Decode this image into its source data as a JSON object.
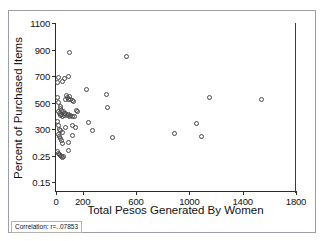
{
  "chart_data": {
    "type": "scatter",
    "title": "",
    "xlabel": "Total Pesos Generated By Women",
    "ylabel": "Percent of Purchased Items",
    "xlim": [
      0,
      1800
    ],
    "ylim_index": [
      0,
      6
    ],
    "grid": false,
    "legend": null,
    "marker": "open-circle",
    "xticks": [
      0,
      200,
      600,
      1000,
      1400,
      1800
    ],
    "xtick_labels": [
      "0",
      "200",
      "600",
      "1000",
      "1400",
      "1800"
    ],
    "ytick_labels": [
      "1100",
      "900",
      "700",
      "500",
      "300",
      "0.25",
      "0.15"
    ],
    "ytick_values": [
      1100,
      900,
      700,
      500,
      300,
      125,
      15
    ],
    "annotation": "Correlation: r=..07853",
    "points": [
      {
        "x": 10,
        "y": 650
      },
      {
        "x": 20,
        "y": 690
      },
      {
        "x": 48,
        "y": 660
      },
      {
        "x": 60,
        "y": 680
      },
      {
        "x": 95,
        "y": 695
      },
      {
        "x": 100,
        "y": 880
      },
      {
        "x": 12,
        "y": 540
      },
      {
        "x": 18,
        "y": 500
      },
      {
        "x": 30,
        "y": 470
      },
      {
        "x": 35,
        "y": 455
      },
      {
        "x": 40,
        "y": 440
      },
      {
        "x": 55,
        "y": 430
      },
      {
        "x": 62,
        "y": 420
      },
      {
        "x": 70,
        "y": 525
      },
      {
        "x": 78,
        "y": 555
      },
      {
        "x": 85,
        "y": 540
      },
      {
        "x": 92,
        "y": 520
      },
      {
        "x": 100,
        "y": 545
      },
      {
        "x": 108,
        "y": 520
      },
      {
        "x": 120,
        "y": 512
      },
      {
        "x": 128,
        "y": 505
      },
      {
        "x": 20,
        "y": 430
      },
      {
        "x": 26,
        "y": 415
      },
      {
        "x": 34,
        "y": 400
      },
      {
        "x": 44,
        "y": 412
      },
      {
        "x": 52,
        "y": 398
      },
      {
        "x": 66,
        "y": 405
      },
      {
        "x": 74,
        "y": 420
      },
      {
        "x": 88,
        "y": 400
      },
      {
        "x": 96,
        "y": 408
      },
      {
        "x": 104,
        "y": 398
      },
      {
        "x": 112,
        "y": 405
      },
      {
        "x": 126,
        "y": 395
      },
      {
        "x": 140,
        "y": 392
      },
      {
        "x": 150,
        "y": 440
      },
      {
        "x": 160,
        "y": 430
      },
      {
        "x": 14,
        "y": 355
      },
      {
        "x": 22,
        "y": 330
      },
      {
        "x": 28,
        "y": 300
      },
      {
        "x": 36,
        "y": 290
      },
      {
        "x": 46,
        "y": 280
      },
      {
        "x": 70,
        "y": 310
      },
      {
        "x": 120,
        "y": 330
      },
      {
        "x": 145,
        "y": 310
      },
      {
        "x": 16,
        "y": 262
      },
      {
        "x": 24,
        "y": 250
      },
      {
        "x": 32,
        "y": 235
      },
      {
        "x": 40,
        "y": 222
      },
      {
        "x": 50,
        "y": 205
      },
      {
        "x": 120,
        "y": 260
      },
      {
        "x": 90,
        "y": 212
      },
      {
        "x": 10,
        "y": 150
      },
      {
        "x": 18,
        "y": 140
      },
      {
        "x": 26,
        "y": 132
      },
      {
        "x": 34,
        "y": 126
      },
      {
        "x": 42,
        "y": 120
      },
      {
        "x": 50,
        "y": 118
      },
      {
        "x": 58,
        "y": 122
      },
      {
        "x": 96,
        "y": 160
      },
      {
        "x": 230,
        "y": 600
      },
      {
        "x": 240,
        "y": 350
      },
      {
        "x": 270,
        "y": 290
      },
      {
        "x": 380,
        "y": 560
      },
      {
        "x": 385,
        "y": 465
      },
      {
        "x": 420,
        "y": 245
      },
      {
        "x": 530,
        "y": 845
      },
      {
        "x": 890,
        "y": 272
      },
      {
        "x": 1050,
        "y": 340
      },
      {
        "x": 1090,
        "y": 248
      },
      {
        "x": 1150,
        "y": 535
      },
      {
        "x": 1540,
        "y": 525
      }
    ]
  },
  "axes": {
    "y_title": "Percent of Purchased Items",
    "x_title": "Total Pesos Generated By Women"
  },
  "caption": {
    "correlation_text": "Correlation: r=..07853"
  }
}
